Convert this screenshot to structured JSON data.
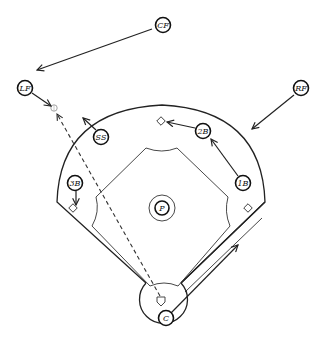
{
  "diagram": {
    "type": "baseball-defensive-play",
    "colors": {
      "line": "#222222",
      "background": "#ffffff",
      "ball": "#999999"
    },
    "positions": [
      {
        "id": "cf",
        "label": "CF"
      },
      {
        "id": "lf",
        "label": "LF"
      },
      {
        "id": "rf",
        "label": "RF"
      },
      {
        "id": "ss",
        "label": "SS"
      },
      {
        "id": "2b",
        "label": "2B"
      },
      {
        "id": "1b",
        "label": "1B"
      },
      {
        "id": "3b",
        "label": "3B"
      },
      {
        "id": "p",
        "label": "P"
      },
      {
        "id": "c",
        "label": "C"
      }
    ],
    "movements": [
      {
        "from": "CF",
        "to": "left-field"
      },
      {
        "from": "LF",
        "to": "ball"
      },
      {
        "from": "RF",
        "to": "right-center"
      },
      {
        "from": "SS",
        "to": "shallow-left"
      },
      {
        "from": "2B",
        "to": "second-base"
      },
      {
        "from": "1B",
        "to": "second-base-area"
      },
      {
        "from": "3B",
        "to": "third-base"
      },
      {
        "from": "C",
        "to": "first-base-line"
      }
    ],
    "ball_path": {
      "from": "home-plate",
      "to": "left-field",
      "style": "dashed"
    }
  }
}
